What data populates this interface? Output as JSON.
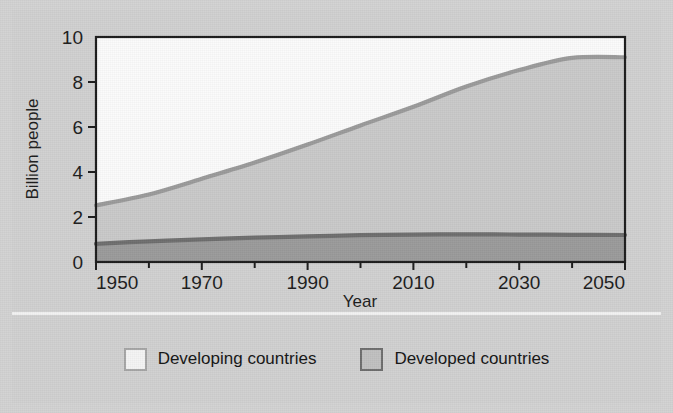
{
  "chart_data": {
    "type": "area",
    "title": "",
    "xlabel": "Year",
    "ylabel": "Billion people",
    "xlim": [
      1950,
      2050
    ],
    "ylim": [
      0,
      10
    ],
    "grid": false,
    "legend_position": "bottom",
    "stacked": true,
    "x_ticks": [
      1950,
      1970,
      1990,
      2010,
      2030,
      2050
    ],
    "x_tick_labels": [
      "1950",
      "1970",
      "1990",
      "2010",
      "2030",
      "2050"
    ],
    "x_minor_tick_step": 10,
    "y_ticks": [
      0,
      2,
      4,
      6,
      8,
      10
    ],
    "y_tick_labels": [
      "0",
      "2",
      "4",
      "6",
      "8",
      "10"
    ],
    "x": [
      1950,
      1960,
      1970,
      1980,
      1990,
      2000,
      2010,
      2020,
      2030,
      2040,
      2050
    ],
    "series": [
      {
        "name": "Developed countries",
        "color": "#9a9a9a",
        "line_color": "#6e6e6e",
        "values": [
          0.81,
          0.92,
          1.01,
          1.08,
          1.14,
          1.19,
          1.22,
          1.23,
          1.22,
          1.21,
          1.2
        ]
      },
      {
        "name": "Developing countries",
        "color": "#c9c9c9",
        "line_color": "#9a9a9a",
        "values": [
          1.71,
          2.08,
          2.69,
          3.34,
          4.08,
          4.88,
          5.68,
          6.57,
          7.31,
          7.86,
          7.9
        ]
      }
    ],
    "totals": [
      2.52,
      3.0,
      3.7,
      4.42,
      5.22,
      6.07,
      6.9,
      7.8,
      8.53,
      9.07,
      9.1
    ],
    "annotations": []
  },
  "legend": {
    "entries": [
      {
        "label": "Developing countries",
        "swatch": "light-box-swatch"
      },
      {
        "label": "Developed countries",
        "swatch": "grey-box-swatch"
      }
    ]
  },
  "colors": {
    "page_background": "#d2d2d2",
    "panel_background": "#d0d0d0",
    "plot_upper_background": "#fbfbfb",
    "developing_fill": "#c9c9c9",
    "developed_fill": "#9a9a9a",
    "total_line": "#8f8f8f",
    "developed_line": "#6e6e6e",
    "axis": "#1c1c1c",
    "separator": "#f2f2f2"
  }
}
